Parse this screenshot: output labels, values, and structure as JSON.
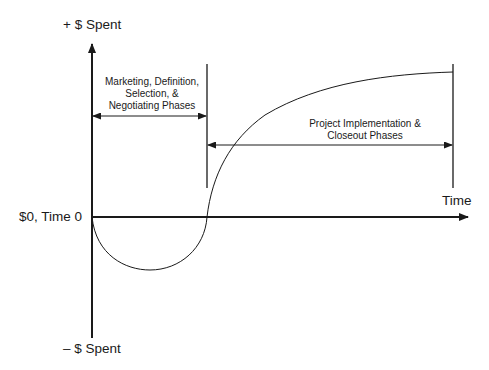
{
  "diagram": {
    "y_axis": {
      "top_label": "+ $ Spent",
      "bottom_label": "– $ Spent"
    },
    "x_axis": {
      "label": "Time",
      "origin_label": "$0, Time 0"
    },
    "phases": [
      {
        "label": "Marketing, Definition, Selection, & Negotiating Phases"
      },
      {
        "label": "Project Implementation & Closeout Phases"
      }
    ],
    "colors": {
      "line": "#1a1a1a",
      "background": "#ffffff",
      "bleed_text": "#d6d6d6"
    }
  }
}
